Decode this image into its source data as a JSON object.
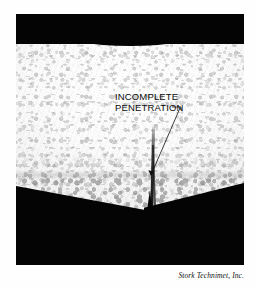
{
  "page": {
    "background_color": "#ffffff"
  },
  "micrograph": {
    "alt": "weld cross-section micrograph",
    "frame_color": "#050505",
    "matrix_color": "#fbfbfb",
    "notch_color": "#040404"
  },
  "annotation": {
    "line1": "INCOMPLETE",
    "line2": "PENETRATION",
    "text_color": "#0b0b0b",
    "leader": {
      "start_x": 180,
      "start_y": 108,
      "end_x": 150,
      "end_y": 176,
      "color": "#101010"
    }
  },
  "credit": {
    "text": "Stork Technimet, Inc.",
    "color": "#111111"
  }
}
